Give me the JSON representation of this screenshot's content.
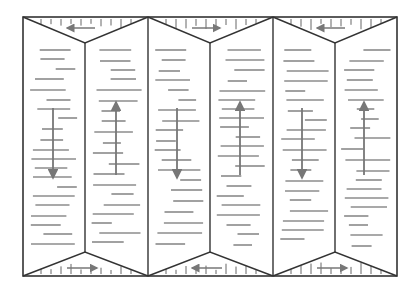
{
  "diagram": {
    "title": "",
    "type": "fold pattern / pleated panel diagram",
    "frame": {
      "x0": 23,
      "y0": 17,
      "x1": 397,
      "y1": 276
    },
    "columns": [
      23,
      85,
      148,
      210,
      273,
      335,
      397
    ],
    "colors": {
      "line": "#333333",
      "arrow": "#777777",
      "background": "#ffffff"
    },
    "top_triangles": [
      {
        "left": 23,
        "right": 148,
        "apex_x": 85,
        "apex_y": 43,
        "arrow": "left"
      },
      {
        "left": 148,
        "right": 273,
        "apex_x": 210,
        "apex_y": 43,
        "arrow": "right"
      },
      {
        "left": 273,
        "right": 397,
        "apex_x": 335,
        "apex_y": 43,
        "arrow": "left"
      }
    ],
    "bottom_triangles": [
      {
        "left": 23,
        "right": 148,
        "apex_x": 85,
        "apex_y": 252,
        "arrow": "right"
      },
      {
        "left": 148,
        "right": 273,
        "apex_x": 210,
        "apex_y": 252,
        "arrow": "left"
      },
      {
        "left": 273,
        "right": 397,
        "apex_x": 335,
        "apex_y": 252,
        "arrow": "right"
      }
    ],
    "vertical_arrows": [
      {
        "x": 53,
        "y_start": 108,
        "y_end": 178,
        "direction": "down"
      },
      {
        "x": 116,
        "y_start": 175,
        "y_end": 102,
        "direction": "up"
      },
      {
        "x": 177,
        "y_start": 108,
        "y_end": 178,
        "direction": "down"
      },
      {
        "x": 240,
        "y_start": 175,
        "y_end": 102,
        "direction": "up"
      },
      {
        "x": 302,
        "y_start": 108,
        "y_end": 178,
        "direction": "down"
      },
      {
        "x": 364,
        "y_start": 175,
        "y_end": 102,
        "direction": "up"
      }
    ]
  }
}
